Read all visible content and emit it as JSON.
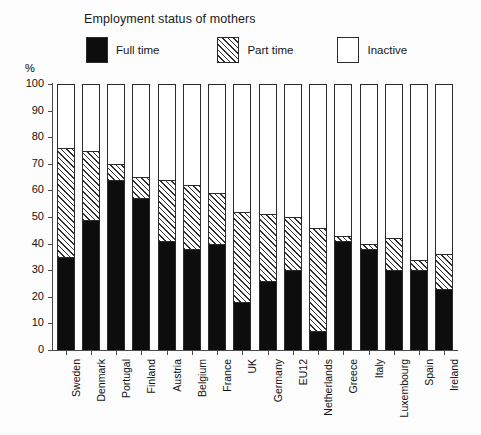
{
  "chart_data": {
    "type": "bar",
    "subtype": "stacked-vertical-100",
    "title": "Employment status of mothers",
    "xlabel": "",
    "ylabel": "%",
    "ylim": [
      0,
      100
    ],
    "yticks": [
      0,
      10,
      20,
      30,
      40,
      50,
      60,
      70,
      80,
      90,
      100
    ],
    "grid": false,
    "legend_position": "top",
    "categories": [
      "Sweden",
      "Denmark",
      "Portugal",
      "Finland",
      "Austria",
      "Belgium",
      "France",
      "UK",
      "Germany",
      "EU12",
      "Netherlands",
      "Greece",
      "Italy",
      "Luxembourg",
      "Spain",
      "Ireland"
    ],
    "series": [
      {
        "name": "Full time",
        "pattern": "solid-black",
        "values": [
          35,
          49,
          64,
          57,
          41,
          38,
          40,
          18,
          26,
          30,
          7,
          41,
          38,
          30,
          30,
          23
        ]
      },
      {
        "name": "Part time",
        "pattern": "diagonal-hatch",
        "values": [
          41,
          26,
          6,
          8,
          23,
          24,
          19,
          34,
          25,
          20,
          39,
          2,
          2,
          12,
          4,
          13
        ]
      },
      {
        "name": "Inactive",
        "pattern": "dotted",
        "values": [
          24,
          25,
          30,
          35,
          36,
          38,
          41,
          48,
          49,
          50,
          54,
          57,
          60,
          58,
          66,
          64
        ]
      }
    ],
    "cumulative_tops": {
      "full_time": [
        35,
        49,
        64,
        57,
        41,
        38,
        40,
        18,
        26,
        30,
        7,
        41,
        38,
        30,
        30,
        23
      ],
      "part_time": [
        76,
        75,
        70,
        65,
        64,
        62,
        59,
        52,
        51,
        50,
        46,
        43,
        40,
        42,
        34,
        36
      ]
    }
  },
  "legend": {
    "items": [
      {
        "label": "Full time"
      },
      {
        "label": "Part time"
      },
      {
        "label": "Inactive"
      }
    ]
  }
}
